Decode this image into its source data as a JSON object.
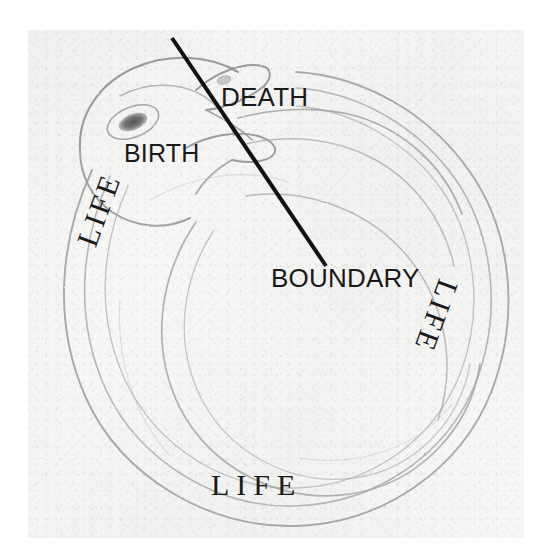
{
  "figure": {
    "medium": "pencil drawing on textured paper",
    "background_color": "#f7f7f6",
    "ink_color": "#1a1a1a",
    "pencil_color": "#9a9a9a"
  },
  "labels": {
    "death": "DEATH",
    "birth": "BIRTH",
    "boundary": "BOUNDARY",
    "life_left": "LIFE",
    "life_right": "LIFE",
    "life_bottom": "LIFE"
  },
  "annotations": {
    "boundary_line": {
      "name": "boundary-leader-line",
      "color": "#111111",
      "width_px": 4,
      "x1": 172,
      "y1": 38,
      "x2": 326,
      "y2": 266
    }
  },
  "drawing_elements": {
    "snake_head": "snake-head",
    "snake_eye": "snake-eye",
    "snake_jaw_upper": "snake-upper-jaw",
    "snake_jaw_lower": "snake-lower-jaw",
    "snake_tail": "snake-tail",
    "snake_body_coils": "snake-body-coils"
  }
}
